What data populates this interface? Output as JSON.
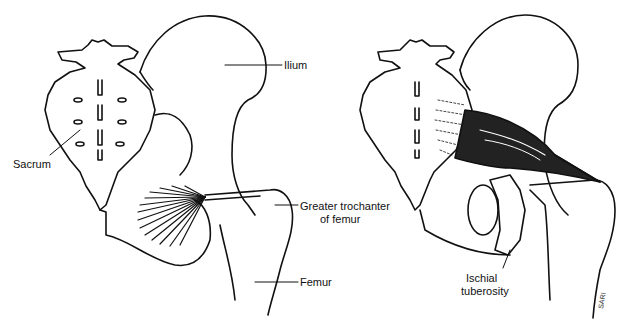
{
  "figure": {
    "panels": [
      {
        "id": "left",
        "labels": {
          "ilium": "Ilium",
          "sacrum": "Sacrum",
          "greater_trochanter_line1": "Greater trochanter",
          "greater_trochanter_line2": "of femur",
          "femur": "Femur"
        }
      },
      {
        "id": "right",
        "labels": {
          "ischial_line1": "Ischial",
          "ischial_line2": "tuberosity"
        },
        "signature": "SARI"
      }
    ],
    "colors": {
      "line": "#111111",
      "background": "#ffffff"
    }
  }
}
